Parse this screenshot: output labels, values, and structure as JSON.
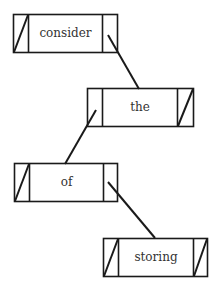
{
  "diagram": {
    "type": "linked-list",
    "nodes": [
      {
        "label": "consider",
        "x": 13,
        "y": 14,
        "w": 104,
        "h": 38,
        "left_cell_w": 15,
        "right_cell_w": 15,
        "left_null": true,
        "right_null": false
      },
      {
        "label": "the",
        "x": 87,
        "y": 88,
        "w": 106,
        "h": 38,
        "left_cell_w": 15,
        "right_cell_w": 16,
        "left_null": false,
        "right_null": true
      },
      {
        "label": "of",
        "x": 14,
        "y": 163,
        "w": 103,
        "h": 38,
        "left_cell_w": 15,
        "right_cell_w": 14,
        "left_null": true,
        "right_null": false
      },
      {
        "label": "storing",
        "x": 103,
        "y": 238,
        "w": 104,
        "h": 38,
        "left_cell_w": 15,
        "right_cell_w": 14,
        "left_null": true,
        "right_null": true
      }
    ],
    "links": [
      {
        "from": "consider.right",
        "to": "the",
        "x1": 108,
        "y1": 35,
        "x2": 139,
        "y2": 89
      },
      {
        "from": "the.left",
        "to": "of",
        "x1": 96,
        "y1": 110,
        "x2": 65,
        "y2": 164
      },
      {
        "from": "of.right",
        "to": "storing",
        "x1": 108,
        "y1": 182,
        "x2": 155,
        "y2": 238
      }
    ],
    "colors": {
      "stroke": "#1a1a1a",
      "text": "#333333",
      "background": "#ffffff"
    }
  }
}
